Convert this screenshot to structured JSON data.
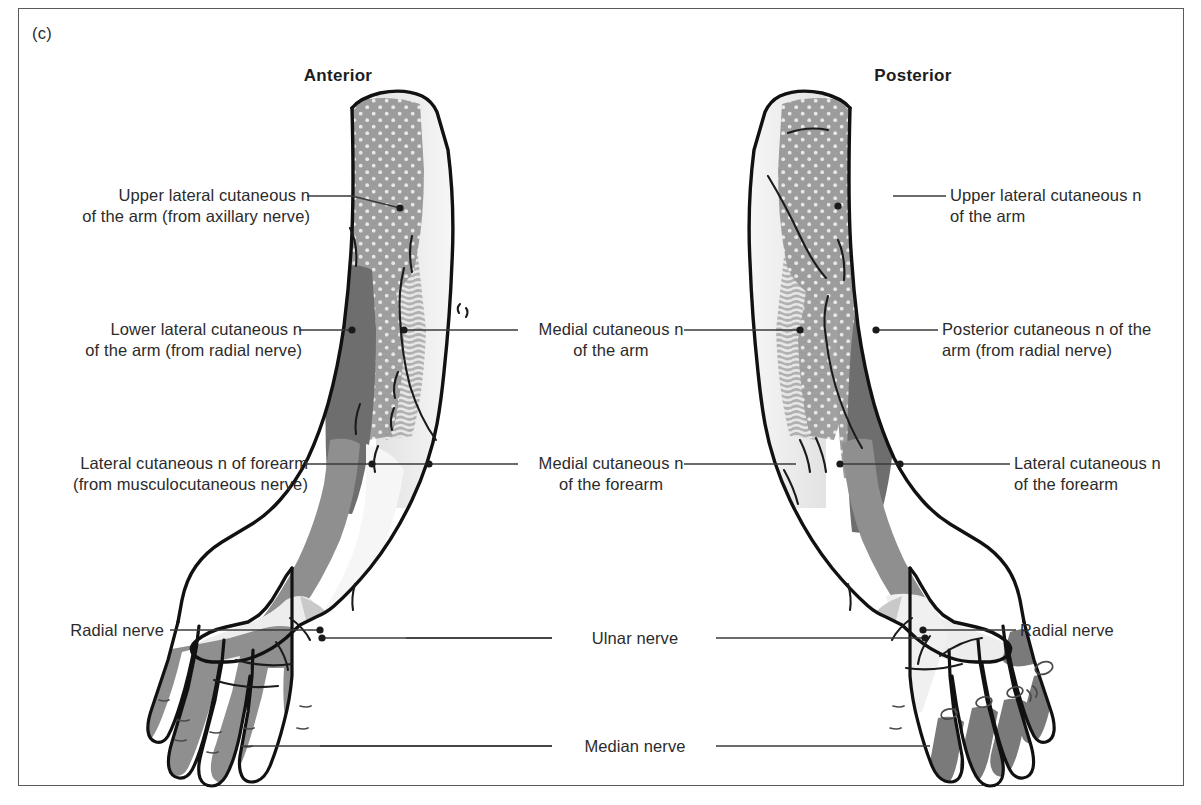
{
  "figure": {
    "panel_letter": "(c)",
    "caption_titles": {
      "anterior": "Anterior",
      "posterior": "Posterior"
    }
  },
  "labels": {
    "upper_lateral_anterior": {
      "line1": "Upper lateral cutaneous n",
      "line2": "of the arm (from axillary nerve)"
    },
    "lower_lateral_anterior": {
      "line1": "Lower lateral cutaneous n",
      "line2": "of the arm (from radial nerve)"
    },
    "lateral_cut_forearm_anterior": {
      "line1": "Lateral cutaneous n of forearm",
      "line2": "(from musculocutaneous nerve)"
    },
    "radial_nerve_left": {
      "line1": "Radial nerve",
      "line2": ""
    },
    "medial_cut_arm": {
      "line1": "Medial cutaneous n",
      "line2": "of the arm"
    },
    "medial_cut_forearm": {
      "line1": "Medial cutaneous n",
      "line2": "of the forearm"
    },
    "ulnar_nerve": {
      "line1": "Ulnar nerve",
      "line2": ""
    },
    "median_nerve": {
      "line1": "Median nerve",
      "line2": ""
    },
    "upper_lateral_posterior": {
      "line1": "Upper lateral cutaneous n",
      "line2": "of the arm"
    },
    "posterior_cut_arm": {
      "line1": "Posterior cutaneous n of the",
      "line2": "arm (from radial nerve)"
    },
    "lateral_cut_forearm_posterior": {
      "line1": "Lateral cutaneous n",
      "line2": "of the forearm"
    },
    "radial_nerve_right": {
      "line1": "Radial nerve",
      "line2": ""
    }
  },
  "colors": {
    "outline": "#111111",
    "frame": "#5a5a5a",
    "leader": "#3a3a3a",
    "text": "#2b2b2b",
    "skin_white": "#ffffff",
    "dotted_gray": "#9c9c9c",
    "dotted_dot": "#e6e6e6",
    "dark_gray": "#6e6e6e",
    "striped_gray": "#b5b5b5",
    "striped_line": "#e3e3e3",
    "mid_gray": "#8f8f8f",
    "light_gray": "#d4d4d4",
    "pale_gray": "#ededed",
    "very_light": "#f3f3f3"
  },
  "regions": {
    "anterior": [
      {
        "name": "upper-lateral-cutaneous-arm",
        "texture": "dotted",
        "shade": "#9c9c9c"
      },
      {
        "name": "lower-lateral-cutaneous-arm",
        "texture": "solid",
        "shade": "#6e6e6e"
      },
      {
        "name": "medial-cutaneous-arm",
        "texture": "striped",
        "shade": "#b5b5b5"
      },
      {
        "name": "lateral-cutaneous-forearm",
        "texture": "solid",
        "shade": "#8f8f8f"
      },
      {
        "name": "medial-cutaneous-forearm",
        "texture": "solid",
        "shade": "#f3f3f3"
      },
      {
        "name": "radial-nerve-hand",
        "texture": "solid",
        "shade": "#ededed"
      },
      {
        "name": "median-nerve-hand",
        "texture": "solid",
        "shade": "#8f8f8f"
      },
      {
        "name": "ulnar-nerve-hand",
        "texture": "solid",
        "shade": "#c4c4c4"
      }
    ],
    "posterior": [
      {
        "name": "upper-lateral-cutaneous-arm",
        "texture": "dotted",
        "shade": "#9c9c9c"
      },
      {
        "name": "posterior-cutaneous-arm",
        "texture": "solid",
        "shade": "#6e6e6e"
      },
      {
        "name": "medial-cutaneous-arm",
        "texture": "striped",
        "shade": "#b5b5b5"
      },
      {
        "name": "lateral-cutaneous-forearm",
        "texture": "solid",
        "shade": "#8f8f8f"
      },
      {
        "name": "radial-nerve-hand",
        "texture": "solid",
        "shade": "#ededed"
      },
      {
        "name": "median-nerve-hand",
        "texture": "solid",
        "shade": "#7a7a7a"
      },
      {
        "name": "ulnar-nerve-hand",
        "texture": "solid",
        "shade": "#c4c4c4"
      }
    ]
  }
}
